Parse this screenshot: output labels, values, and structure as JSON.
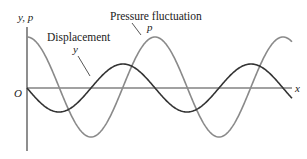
{
  "diagram": {
    "type": "wave-plot",
    "axes": {
      "y_label": "y, p",
      "x_label": "x",
      "origin_label": "O"
    },
    "curves": [
      {
        "name": "Displacement",
        "symbol": "y",
        "color": "#333333",
        "shape": "negative sine",
        "amplitude_px": 24,
        "period_px": 128,
        "phase_start": "zero, going down"
      },
      {
        "name": "Pressure fluctuation",
        "symbol": "p",
        "color": "#8a8a8a",
        "shape": "cosine",
        "amplitude_px": 50,
        "period_px": 128,
        "phase_start": "maximum"
      }
    ],
    "labels": {
      "pressure_title": "Pressure fluctuation",
      "pressure_symbol": "p",
      "displacement_title": "Displacement",
      "displacement_symbol": "y"
    },
    "colors": {
      "axis": "#444444",
      "displacement": "#333333",
      "pressure": "#8a8a8a"
    }
  }
}
